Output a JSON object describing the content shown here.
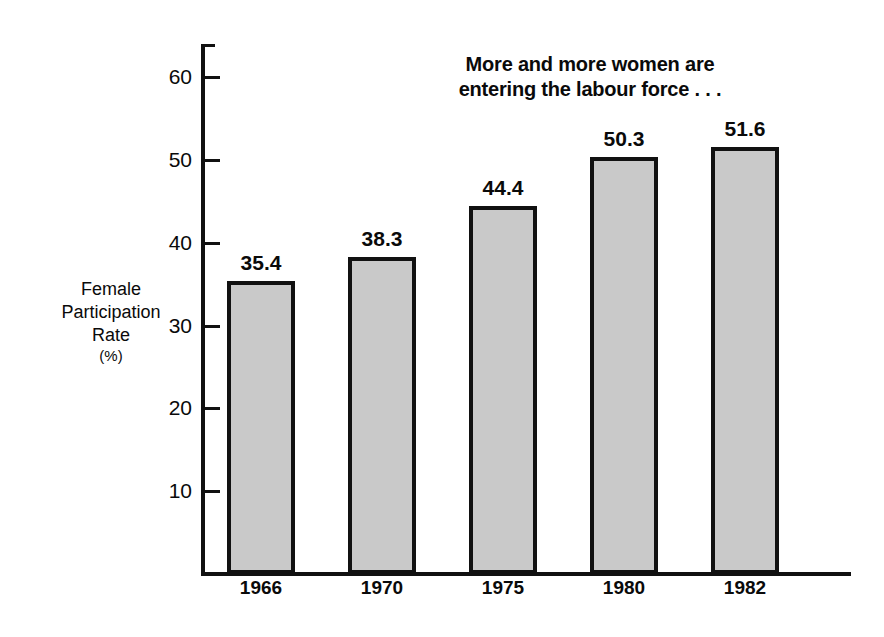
{
  "chart_data": {
    "type": "bar",
    "title": "More and more women are\nentering the labour force . . .",
    "title_line1": "More and more women are",
    "title_line2": "entering the labour force . . .",
    "xlabel": "",
    "ylabel": "Female\nParticipation\nRate",
    "ylabel_line1": "Female",
    "ylabel_line2": "Participation",
    "ylabel_line3": "Rate",
    "yunit": "(%)",
    "categories": [
      "1966",
      "1970",
      "1975",
      "1980",
      "1982"
    ],
    "values": [
      35.4,
      38.3,
      44.4,
      50.3,
      51.6
    ],
    "value_labels": [
      "35.4",
      "38.3",
      "44.4",
      "50.3",
      "51.6"
    ],
    "ylim": [
      0,
      64
    ],
    "yticks": [
      10,
      20,
      30,
      40,
      50,
      60
    ],
    "ytick_labels": [
      "10",
      "20",
      "30",
      "40",
      "50",
      "60"
    ],
    "grid": false,
    "legend": null,
    "bar_fill_color": "#c9c9c9",
    "bar_edge_color": "#111111",
    "background_color": "#ffffff",
    "text_color": "#0a0a0a"
  }
}
